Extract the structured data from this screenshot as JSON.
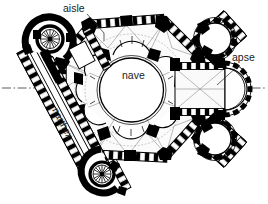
{
  "figure": {
    "kind": "architectural-floor-plan",
    "background_color": "#ffffff",
    "ink_color": "#000000",
    "vault_rib_color": "#8b8b8b",
    "width_px": 268,
    "height_px": 204
  },
  "labels": [
    {
      "id": "aisle",
      "text": "aisle",
      "x": 63,
      "y": 12,
      "rotation_deg": 0,
      "leader": {
        "from_x": 87,
        "from_y": 14,
        "to_x": 104,
        "to_y": 33
      }
    },
    {
      "id": "nave",
      "text": "nave",
      "x": 122,
      "y": 79,
      "rotation_deg": 0,
      "leader": null
    },
    {
      "id": "apse",
      "text": "apse",
      "x": 232,
      "y": 61,
      "rotation_deg": 0,
      "leader": {
        "from_x": 238,
        "from_y": 65,
        "to_x": 215,
        "to_y": 85
      }
    },
    {
      "id": "narthex",
      "text": "narthex",
      "x": 52,
      "y": 110,
      "rotation_deg": 62,
      "leader": null
    }
  ],
  "axis": {
    "id": "main-axis",
    "style": "dash-dot",
    "x1": 2,
    "y1": 88,
    "x2": 266,
    "y2": 88
  },
  "plan_parts": [
    {
      "id": "outer-octagon-wall",
      "description": "thick hatched octagonal perimeter wall with corner piers"
    },
    {
      "id": "ambulatory",
      "description": "ring aisle between outer octagon and inner arcade"
    },
    {
      "id": "inner-arcade",
      "description": "ring of eight radiating exedrae around the central space"
    },
    {
      "id": "central-nave-circle",
      "description": "central domed rotunda, open circular floor"
    },
    {
      "id": "chancel-bay",
      "description": "rectangular eastern bay with diagonal cross ribs"
    },
    {
      "id": "apse-semicircle",
      "description": "semicircular eastern apse terminating the chancel"
    },
    {
      "id": "narthex-corridor",
      "description": "long diagonal entrance corridor to the south-west"
    },
    {
      "id": "stair-tower-north",
      "description": "circular spiral stair tower, north-west"
    },
    {
      "id": "stair-tower-south",
      "description": "circular spiral stair tower, south-west"
    },
    {
      "id": "chapel-tower-northeast",
      "description": "circular chapel tower, north-east"
    },
    {
      "id": "chapel-tower-southeast",
      "description": "circular chapel tower, south-east"
    }
  ]
}
